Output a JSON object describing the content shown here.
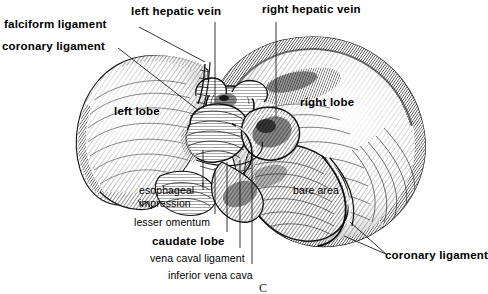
{
  "figure": {
    "caption_mark": "C",
    "background_color": "#ffffff",
    "ink_color": "#000000"
  },
  "labels": {
    "falciform_ligament": "falciform ligament",
    "coronary_ligament_left": "coronary ligament",
    "left_hepatic_vein": "left hepatic vein",
    "right_hepatic_vein": "right hepatic vein",
    "left_lobe": "left lobe",
    "right_lobe": "right lobe",
    "bare_area": "bare area",
    "esophageal_impression_line1": "esophageal",
    "esophageal_impression_line2": "impression",
    "lesser_omentum": "lesser omentum",
    "caudate_lobe": "caudate lobe",
    "vena_caval_ligament": "vena caval ligament",
    "inferior_vena_cava": "inferior vena cava",
    "coronary_ligament_right": "coronary ligament"
  }
}
